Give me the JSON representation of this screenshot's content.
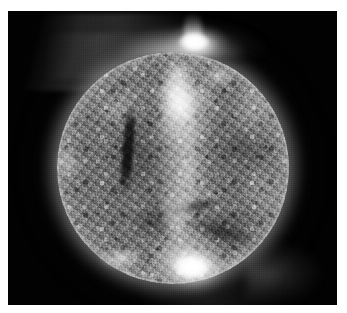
{
  "image": {
    "subject": "Sun",
    "kind": "solar-disk-euv-grayscale",
    "title": "",
    "caption": "",
    "has_caption": false,
    "palette": {
      "page_background": "#ffffff",
      "sky_background": "#020202",
      "disk_midtone": "#747474",
      "disk_highlight": "#ffffff",
      "disk_shadow": "#0a0a0a",
      "corona_glow": "#a8a8a8",
      "limb_ring": "#c4c4c4"
    },
    "frame": {
      "canvas_width_px": 347,
      "canvas_height_px": 313,
      "plate_left_px": 8,
      "plate_top_px": 11,
      "plate_width_px": 329,
      "plate_height_px": 294
    },
    "disk": {
      "center_x_px": 165,
      "center_y_px": 157,
      "radius_px": 116
    },
    "features": [
      {
        "name": "north-polar-flare",
        "label": "bright polar active region / flare above north limb"
      },
      {
        "name": "south-active-region",
        "label": "bright active region near south limb"
      },
      {
        "name": "central-bright-band",
        "label": "bright meridional band across disk center"
      },
      {
        "name": "dark-filament-left",
        "label": "dark filament channel on eastern hemisphere"
      },
      {
        "name": "coronal-halo",
        "label": "diffuse coronal halo surrounding the limb"
      },
      {
        "name": "streamer-upper-left",
        "label": "faint coronal streamer, upper left"
      },
      {
        "name": "streamer-lower-right",
        "label": "faint coronal glow, lower right"
      },
      {
        "name": "moss-texture",
        "label": "mottled supergranular moss texture"
      }
    ]
  }
}
